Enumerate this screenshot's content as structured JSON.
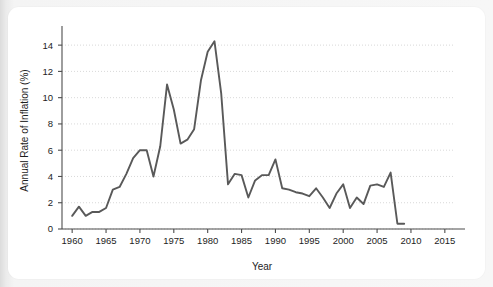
{
  "figure": {
    "panel_background": "#ffffff",
    "surround_background": "#f1f1f1",
    "line_color": "#595959",
    "gridline_color": "#cfcfcf",
    "axis_color": "#4d4d4d",
    "text_color": "#1d1d1d"
  },
  "chart_data": {
    "type": "line",
    "title": "",
    "subtitle": "",
    "xlabel": "Year",
    "ylabel": "Annual Rate of Inflation (%)",
    "xlim": [
      1958.5,
      2016.5
    ],
    "ylim": [
      0,
      15
    ],
    "xticks": [
      1960,
      1965,
      1970,
      1975,
      1980,
      1985,
      1990,
      1995,
      2000,
      2005,
      2010,
      2015
    ],
    "xtick_labels": [
      "1960",
      "1965",
      "1970",
      "1975",
      "1980",
      "1985",
      "1990",
      "1995",
      "2000",
      "2005",
      "2010",
      "2015"
    ],
    "yticks": [
      0,
      2,
      4,
      6,
      8,
      10,
      12,
      14
    ],
    "ytick_labels": [
      "0",
      "2",
      "4",
      "6",
      "8",
      "10",
      "12",
      "14"
    ],
    "grid": "horizontal-dotted",
    "legend": "none",
    "annotations": [],
    "series": [
      {
        "name": "Annual Rate of Inflation",
        "color": "#595959",
        "marker": "none",
        "line_width": 1.9,
        "x": [
          1960,
          1961,
          1962,
          1963,
          1964,
          1965,
          1966,
          1967,
          1968,
          1969,
          1970,
          1971,
          1972,
          1973,
          1974,
          1975,
          1976,
          1977,
          1978,
          1979,
          1980,
          1981,
          1982,
          1983,
          1984,
          1985,
          1986,
          1987,
          1988,
          1989,
          1990,
          1991,
          1992,
          1993,
          1994,
          1995,
          1996,
          1997,
          1998,
          1999,
          2000,
          2001,
          2002,
          2003,
          2004,
          2005,
          2006,
          2007,
          2008,
          2009
        ],
        "y": [
          1.0,
          1.7,
          1.0,
          1.3,
          1.3,
          1.6,
          3.0,
          3.2,
          4.2,
          5.4,
          6.0,
          6.0,
          4.0,
          6.3,
          11.0,
          9.1,
          6.5,
          6.8,
          7.6,
          11.3,
          13.5,
          14.3,
          10.3,
          3.4,
          4.2,
          4.1,
          2.4,
          3.7,
          4.1,
          4.1,
          5.3,
          3.1,
          3.0,
          2.8,
          2.7,
          2.5,
          3.1,
          2.4,
          1.6,
          2.7,
          3.4,
          1.6,
          2.4,
          1.9,
          3.3,
          3.4,
          3.2,
          4.3,
          0.4,
          0.4
        ]
      }
    ]
  }
}
